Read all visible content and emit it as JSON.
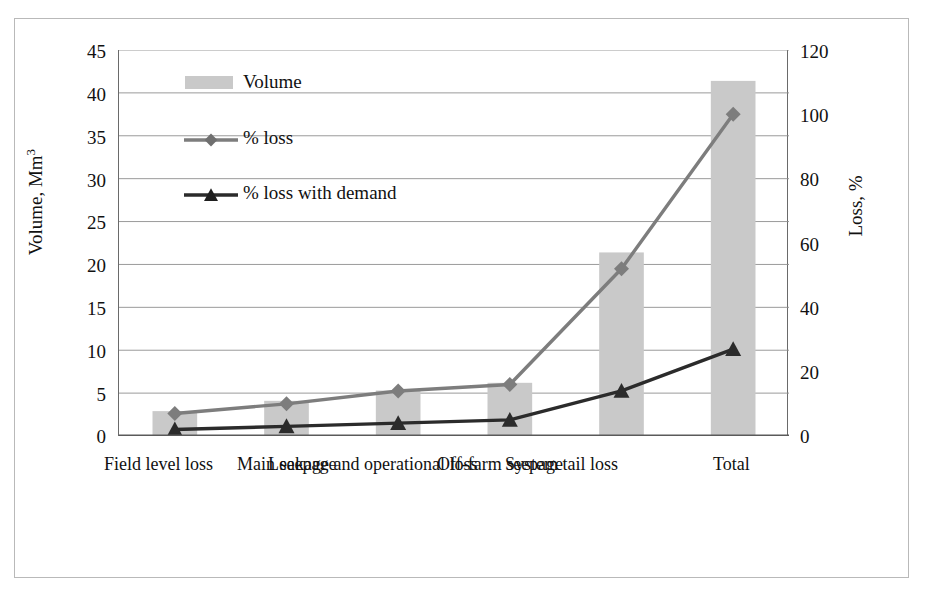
{
  "figure": {
    "background": "#ffffff",
    "frame_color": "#b9b9b9"
  },
  "axes": {
    "left": {
      "label_prefix": "Volume, Mm",
      "label_sup": "3",
      "ticks": [
        "45",
        "40",
        "35",
        "30",
        "25",
        "20",
        "15",
        "10",
        "5",
        "0"
      ],
      "min": 0,
      "max": 45,
      "step": 5
    },
    "right": {
      "label": "Loss, %",
      "ticks": [
        "120",
        "100",
        "80",
        "60",
        "40",
        "20",
        "0"
      ],
      "min": 0,
      "max": 120,
      "step": 20
    }
  },
  "legend": {
    "items": [
      {
        "label": "Volume",
        "type": "bar",
        "color": "#c9c9c9"
      },
      {
        "label": "% loss",
        "type": "line",
        "color": "#7d7d7d",
        "marker": "diamond"
      },
      {
        "label": "% loss with demand",
        "type": "line",
        "color": "#2b2b2b",
        "marker": "triangle"
      }
    ]
  },
  "chart_data": {
    "type": "bar",
    "title": "",
    "subtitle": "",
    "xlabel": "",
    "ylabel": "Volume, Mm3",
    "y2label": "Loss, %",
    "ylim": [
      0,
      45
    ],
    "y2lim": [
      0,
      120
    ],
    "grid": true,
    "legend_position": "upper-left-inside",
    "categories": [
      "Field level loss",
      "Main seepage",
      "Leakage and operational loss",
      "Off-farm seepage",
      "System tail loss",
      "Total"
    ],
    "series": [
      {
        "name": "Volume",
        "axis": "left",
        "units": "Mm3",
        "type": "bar",
        "color": "#c9c9c9",
        "values": [
          2.9,
          4.1,
          5.3,
          6.2,
          21.4,
          41.4
        ]
      },
      {
        "name": "% loss",
        "axis": "right",
        "units": "%",
        "type": "line",
        "color": "#7d7d7d",
        "marker": "diamond",
        "values": [
          7,
          10,
          14,
          16,
          52,
          100
        ]
      },
      {
        "name": "% loss with demand",
        "axis": "right",
        "units": "%",
        "type": "line",
        "color": "#2b2b2b",
        "marker": "triangle",
        "values": [
          2,
          3,
          4,
          5,
          14,
          27
        ]
      }
    ]
  }
}
